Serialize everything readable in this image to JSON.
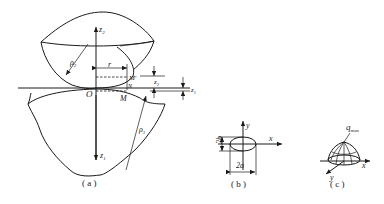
{
  "figure_a": {
    "caption": "( a )",
    "labels": {
      "z2_axis": "z",
      "z2_sub": "2",
      "z1_axis": "z",
      "z1_sub": "1",
      "rho2": "ρ",
      "rho2_sub": "2",
      "rho1": "ρ",
      "rho1_sub": "1",
      "r": "r",
      "origin": "O",
      "M_prime": "M′",
      "N": "N",
      "M": "M",
      "z2_gap": "z",
      "z2_gap_sub": "2",
      "z1_gap": "z",
      "z1_gap_sub": "1"
    }
  },
  "figure_b": {
    "caption": "( b )",
    "labels": {
      "y_axis": "y",
      "x_axis": "x",
      "height": "2b",
      "width": "2a"
    }
  },
  "figure_c": {
    "caption": "( c )",
    "labels": {
      "q": "q",
      "q_sub": "max",
      "x_axis": "x",
      "y_axis": "y"
    }
  },
  "colors": {
    "ink": "#1a1a1a",
    "background": "#ffffff"
  }
}
